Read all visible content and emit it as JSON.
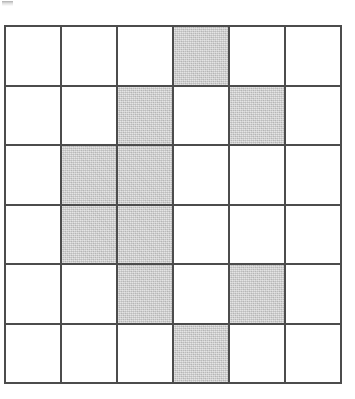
{
  "figure": {
    "type": "shaded-grid",
    "title": "",
    "rows": 6,
    "columns": 6,
    "cell_width_px": 56,
    "cell_height_px": 60,
    "grid_origin": {
      "x": 4,
      "y": 25
    },
    "grid_size": {
      "width": 338,
      "height": 359
    },
    "colors": {
      "background": "#ffffff",
      "grid_line": "#4c4c4c",
      "cell_empty": "#ffffff",
      "cell_shaded": "#c9c9c9"
    },
    "grid_line_width_px": 2,
    "shaded_count": 10,
    "empty_count": 26,
    "shaded_cells_rowcol": [
      [
        1,
        4
      ],
      [
        2,
        3
      ],
      [
        2,
        5
      ],
      [
        3,
        2
      ],
      [
        3,
        3
      ],
      [
        4,
        2
      ],
      [
        4,
        3
      ],
      [
        5,
        3
      ],
      [
        5,
        5
      ],
      [
        6,
        4
      ]
    ],
    "cells": [
      [
        {
          "row": 1,
          "col": 1,
          "state": "empty"
        },
        {
          "row": 1,
          "col": 2,
          "state": "empty"
        },
        {
          "row": 1,
          "col": 3,
          "state": "empty"
        },
        {
          "row": 1,
          "col": 4,
          "state": "shaded"
        },
        {
          "row": 1,
          "col": 5,
          "state": "empty"
        },
        {
          "row": 1,
          "col": 6,
          "state": "empty"
        }
      ],
      [
        {
          "row": 2,
          "col": 1,
          "state": "empty"
        },
        {
          "row": 2,
          "col": 2,
          "state": "empty"
        },
        {
          "row": 2,
          "col": 3,
          "state": "shaded"
        },
        {
          "row": 2,
          "col": 4,
          "state": "empty"
        },
        {
          "row": 2,
          "col": 5,
          "state": "shaded"
        },
        {
          "row": 2,
          "col": 6,
          "state": "empty"
        }
      ],
      [
        {
          "row": 3,
          "col": 1,
          "state": "empty"
        },
        {
          "row": 3,
          "col": 2,
          "state": "shaded"
        },
        {
          "row": 3,
          "col": 3,
          "state": "shaded"
        },
        {
          "row": 3,
          "col": 4,
          "state": "empty"
        },
        {
          "row": 3,
          "col": 5,
          "state": "empty"
        },
        {
          "row": 3,
          "col": 6,
          "state": "empty"
        }
      ],
      [
        {
          "row": 4,
          "col": 1,
          "state": "empty"
        },
        {
          "row": 4,
          "col": 2,
          "state": "shaded"
        },
        {
          "row": 4,
          "col": 3,
          "state": "shaded"
        },
        {
          "row": 4,
          "col": 4,
          "state": "empty"
        },
        {
          "row": 4,
          "col": 5,
          "state": "empty"
        },
        {
          "row": 4,
          "col": 6,
          "state": "empty"
        }
      ],
      [
        {
          "row": 5,
          "col": 1,
          "state": "empty"
        },
        {
          "row": 5,
          "col": 2,
          "state": "empty"
        },
        {
          "row": 5,
          "col": 3,
          "state": "shaded"
        },
        {
          "row": 5,
          "col": 4,
          "state": "empty"
        },
        {
          "row": 5,
          "col": 5,
          "state": "shaded"
        },
        {
          "row": 5,
          "col": 6,
          "state": "empty"
        }
      ],
      [
        {
          "row": 6,
          "col": 1,
          "state": "empty"
        },
        {
          "row": 6,
          "col": 2,
          "state": "empty"
        },
        {
          "row": 6,
          "col": 3,
          "state": "empty"
        },
        {
          "row": 6,
          "col": 4,
          "state": "shaded"
        },
        {
          "row": 6,
          "col": 5,
          "state": "empty"
        },
        {
          "row": 6,
          "col": 6,
          "state": "empty"
        }
      ]
    ]
  },
  "artifact": {
    "name": "scan-smudge",
    "position": {
      "x": 2,
      "y": 1
    },
    "size": {
      "width": 11,
      "height": 5
    }
  }
}
